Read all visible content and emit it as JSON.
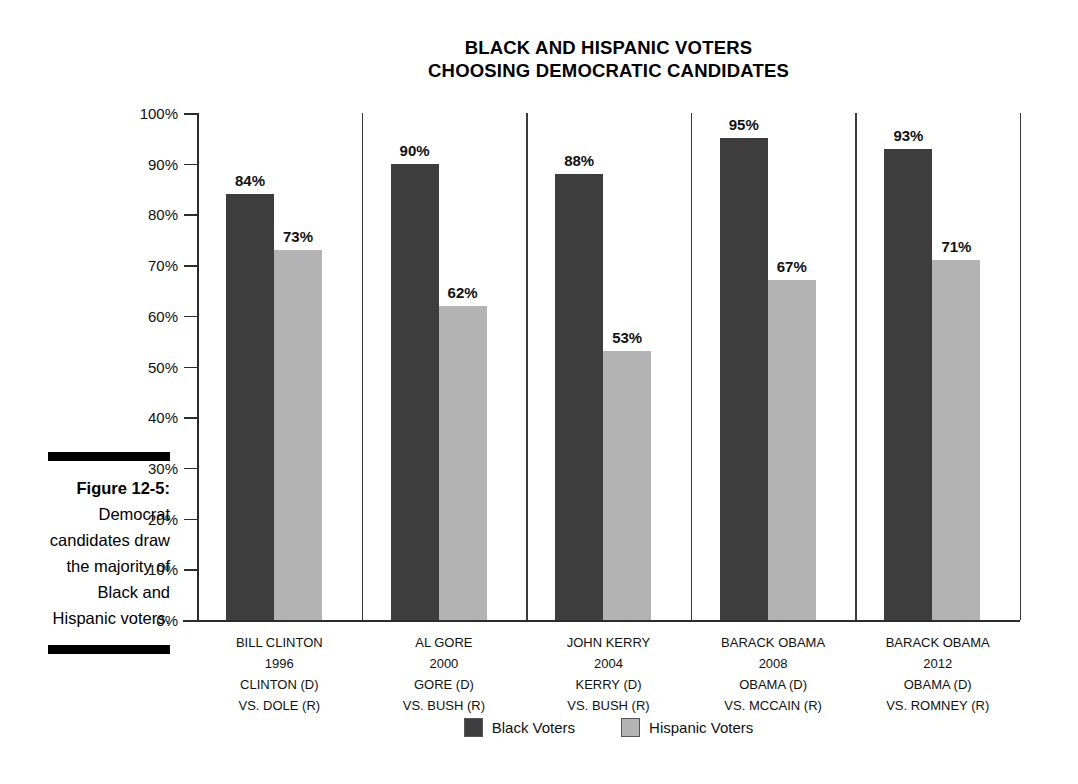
{
  "figure": {
    "number_label": "Figure 12-5:",
    "caption": "Democrat candidates draw the majority of Black and Hispanic voters."
  },
  "chart_data": {
    "type": "bar",
    "title_line1": "BLACK AND HISPANIC VOTERS",
    "title_line2": "CHOOSING DEMOCRATIC CANDIDATES",
    "xlabel": "",
    "ylabel": "",
    "ylim": [
      0,
      100
    ],
    "grid": false,
    "legend_position": "bottom-center",
    "ytick_labels": [
      "100%",
      "90%",
      "80%",
      "70%",
      "60%",
      "50%",
      "40%",
      "30%",
      "20%",
      "10%",
      "0%"
    ],
    "ytick_values": [
      100,
      90,
      80,
      70,
      60,
      50,
      40,
      30,
      20,
      10,
      0
    ],
    "categories": [
      {
        "candidate": "BILL CLINTON",
        "year": "1996",
        "democrat": "CLINTON (D)",
        "republican": "VS. DOLE (R)"
      },
      {
        "candidate": "AL GORE",
        "year": "2000",
        "democrat": "GORE (D)",
        "republican": "VS. BUSH (R)"
      },
      {
        "candidate": "JOHN KERRY",
        "year": "2004",
        "democrat": "KERRY (D)",
        "republican": "VS. BUSH (R)"
      },
      {
        "candidate": "BARACK OBAMA",
        "year": "2008",
        "democrat": "OBAMA (D)",
        "republican": "VS. MCCAIN (R)"
      },
      {
        "candidate": "BARACK OBAMA",
        "year": "2012",
        "democrat": "OBAMA (D)",
        "republican": "VS. ROMNEY (R)"
      }
    ],
    "series": [
      {
        "name": "Black Voters",
        "color": "#3d3d3d",
        "values": [
          84,
          90,
          88,
          95,
          93
        ],
        "value_labels": [
          "84%",
          "90%",
          "88%",
          "95%",
          "93%"
        ]
      },
      {
        "name": "Hispanic Voters",
        "color": "#b3b3b3",
        "values": [
          73,
          62,
          53,
          67,
          71
        ],
        "value_labels": [
          "73%",
          "62%",
          "53%",
          "67%",
          "71%"
        ]
      }
    ]
  }
}
